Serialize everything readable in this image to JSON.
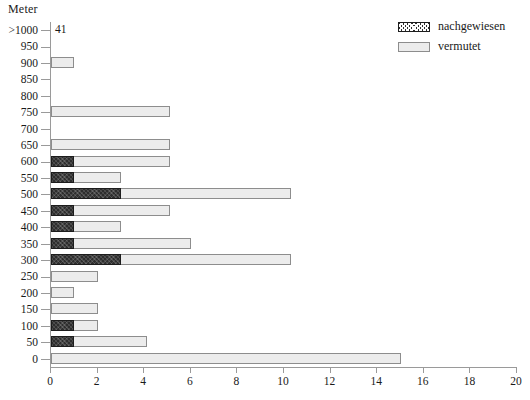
{
  "chart_data": {
    "type": "bar",
    "orientation": "horizontal",
    "stacked": true,
    "title": "",
    "xlabel": "",
    "ylabel": "Meter",
    "xlim": [
      0,
      20
    ],
    "xticks": [
      0,
      2,
      4,
      6,
      8,
      10,
      12,
      14,
      16,
      18,
      20
    ],
    "grid": false,
    "legend_position": "top-right",
    "categories": [
      ">1000",
      "950",
      "900",
      "850",
      "800",
      "750",
      "700",
      "650",
      "600",
      "550",
      "500",
      "450",
      "400",
      "350",
      "300",
      "250",
      "200",
      "150",
      "100",
      "50",
      "0"
    ],
    "series": [
      {
        "name": "nachgewiesen",
        "color": "#2e2e2e",
        "values": [
          0,
          0,
          0,
          0,
          0,
          0,
          0,
          0,
          1,
          1,
          3,
          1,
          1,
          1,
          3,
          0,
          0,
          0,
          1,
          1,
          0
        ]
      },
      {
        "name": "vermutet",
        "color": "#ececec",
        "values": [
          0,
          0,
          1,
          0,
          0,
          5.1,
          0,
          5.1,
          4.1,
          2,
          7.3,
          4.1,
          2,
          5,
          7.3,
          2,
          1,
          2,
          1,
          3.1,
          15
        ]
      }
    ],
    "totals": [
      0,
      0,
      1,
      0,
      0,
      5.1,
      0,
      5.1,
      5.1,
      3,
      10.3,
      5.1,
      3,
      6,
      10.3,
      2,
      1,
      2,
      2,
      4.1,
      15
    ],
    "annotations": [
      {
        "category": ">1000",
        "text": "41"
      }
    ]
  },
  "legend": {
    "items": [
      {
        "label": "nachgewiesen",
        "swatch": "hatched-dark-swatch"
      },
      {
        "label": "vermutet",
        "swatch": "light-gray-swatch"
      }
    ]
  },
  "axis": {
    "y_title": "Meter"
  }
}
